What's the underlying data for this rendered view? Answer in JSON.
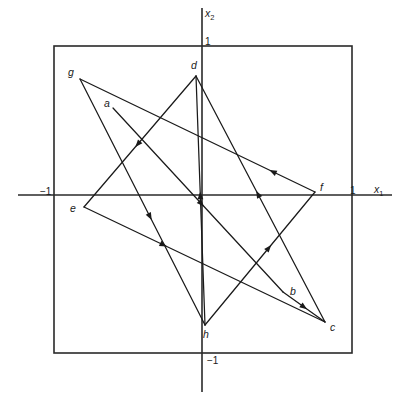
{
  "figure": {
    "title": "",
    "background_color": "#ffffff",
    "line_color": "#1a1a1a",
    "axis_color": "#2a2a2a"
  },
  "axes": {
    "x_axis_label": "x",
    "x_axis_sub": "1",
    "y_axis_label": "x",
    "y_axis_sub": "2",
    "x_ticks": [
      {
        "text": "−1",
        "px": 40,
        "py": 187
      },
      {
        "text": "1",
        "px": 350,
        "py": 186
      }
    ],
    "y_ticks": [
      {
        "text": "1",
        "px": 205,
        "py": 37
      },
      {
        "text": "−1",
        "px": 207,
        "py": 356
      }
    ]
  },
  "unit_box": {
    "left": 54,
    "top": 46,
    "right": 352,
    "bottom": 353
  },
  "chart_data": {
    "type": "scatter",
    "title": "",
    "xlabel": "x1",
    "ylabel": "x2",
    "xlim": [
      -1.34,
      1.34
    ],
    "ylim": [
      -1.34,
      1.34
    ],
    "grid": false,
    "legend": "none",
    "points": [
      {
        "label": "a",
        "px": 113,
        "py": 108,
        "x": -0.6,
        "y": 0.57
      },
      {
        "label": "b",
        "px": 283,
        "py": 292,
        "x": 0.54,
        "y": -0.65
      },
      {
        "label": "c",
        "px": 325,
        "py": 322,
        "x": 0.82,
        "y": -0.85
      },
      {
        "label": "d",
        "px": 196,
        "py": 76,
        "x": -0.04,
        "y": 0.78
      },
      {
        "label": "e",
        "px": 84,
        "py": 207,
        "x": -0.79,
        "y": -0.08
      },
      {
        "label": "f",
        "px": 315,
        "py": 192,
        "x": 0.76,
        "y": 0.02
      },
      {
        "label": "g",
        "px": 80,
        "py": 79,
        "x": -0.82,
        "y": 0.76
      },
      {
        "label": "h",
        "px": 205,
        "py": 325,
        "x": 0.02,
        "y": -0.87
      }
    ],
    "segments": [
      {
        "from": "a",
        "to": "b",
        "arrow_at": 0.52
      },
      {
        "from": "b",
        "to": "c",
        "arrow_at": 0.5
      },
      {
        "from": "c",
        "to": "d",
        "arrow_at": 0.52
      },
      {
        "from": "d",
        "to": "e",
        "arrow_at": 0.52
      },
      {
        "from": "e",
        "to": "c",
        "arrow_at": 0.33
      },
      {
        "from": "f",
        "to": "g",
        "arrow_at": 0.18
      },
      {
        "from": "g",
        "to": "h",
        "arrow_at": 0.56
      },
      {
        "from": "h",
        "to": "d",
        "arrow_at": 0.52
      },
      {
        "from": "h",
        "to": "f",
        "arrow_at": 0.58
      }
    ]
  },
  "point_labels": [
    {
      "name": "a",
      "text": "a",
      "px": 104,
      "py": 98
    },
    {
      "name": "b",
      "text": "b",
      "px": 290,
      "py": 286
    },
    {
      "name": "c",
      "text": "c",
      "px": 330,
      "py": 322
    },
    {
      "name": "d",
      "text": "d",
      "px": 191,
      "py": 60
    },
    {
      "name": "e",
      "text": "e",
      "px": 70,
      "py": 203
    },
    {
      "name": "f",
      "text": "f",
      "px": 320,
      "py": 182
    },
    {
      "name": "g",
      "text": "g",
      "px": 68,
      "py": 67
    },
    {
      "name": "h",
      "text": "h",
      "px": 203,
      "py": 329
    }
  ]
}
